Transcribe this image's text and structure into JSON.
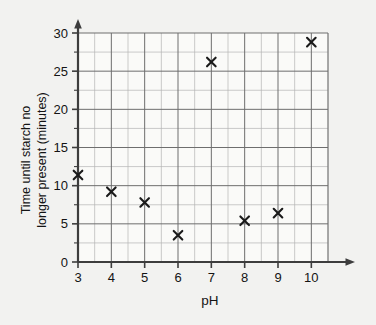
{
  "chart_data": {
    "type": "scatter",
    "title": "",
    "xlabel": "pH",
    "ylabel": "Time until starch no longer present (minutes)",
    "ylabel_line1": "Time until starch no",
    "ylabel_line2": "longer present (minutes)",
    "xlim": [
      3,
      10.5
    ],
    "ylim": [
      0,
      30
    ],
    "xticks": [
      3,
      4,
      5,
      6,
      7,
      8,
      9,
      10
    ],
    "xtick_labels": [
      "3",
      "4",
      "5",
      "6",
      "7",
      "8",
      "9",
      "10"
    ],
    "yticks": [
      0,
      5,
      10,
      15,
      20,
      25,
      30
    ],
    "ytick_labels": [
      "0",
      "5",
      "10",
      "15",
      "20",
      "25",
      "30"
    ],
    "x_minor_step": 0.5,
    "y_minor_step": 2.5,
    "grid": true,
    "legend": false,
    "marker": "x",
    "marker_color": "#1a1a1a",
    "grid_color": "#8c8c8c",
    "axis_color": "#3d3d3d",
    "background_color": "#f2f2f0",
    "plot_background_color": "#fafaf8",
    "x": [
      3,
      4,
      5,
      6,
      7,
      8,
      9,
      10
    ],
    "y": [
      11.4,
      9.2,
      7.8,
      3.5,
      26.2,
      5.4,
      6.4,
      28.8
    ],
    "points": [
      {
        "ph": 3,
        "minutes": 11.4
      },
      {
        "ph": 4,
        "minutes": 9.2
      },
      {
        "ph": 5,
        "minutes": 7.8
      },
      {
        "ph": 6,
        "minutes": 3.5
      },
      {
        "ph": 7,
        "minutes": 26.2
      },
      {
        "ph": 8,
        "minutes": 5.4
      },
      {
        "ph": 9,
        "minutes": 6.4
      },
      {
        "ph": 10,
        "minutes": 28.8
      }
    ]
  }
}
